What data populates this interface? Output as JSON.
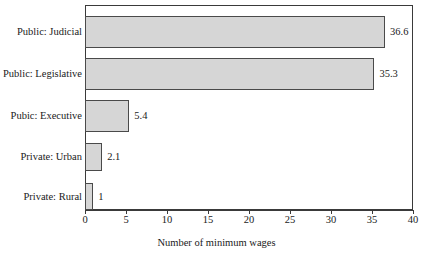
{
  "chart_data": {
    "type": "bar",
    "orientation": "horizontal",
    "title": "",
    "xlabel": "Number of minimum wages",
    "ylabel": "",
    "categories": [
      "Public: Judicial",
      "Public: Legislative",
      "Pubic: Executive",
      "Private: Urban",
      "Private: Rural"
    ],
    "values": [
      36.6,
      35.3,
      5.4,
      2.1,
      1
    ],
    "value_labels": [
      "36.6",
      "35.3",
      "5.4",
      "2.1",
      "1"
    ],
    "xlim": [
      0,
      40
    ],
    "xticks": [
      0,
      5,
      10,
      15,
      20,
      25,
      30,
      35,
      40
    ],
    "xtick_labels": [
      "0",
      "5",
      "10",
      "15",
      "20",
      "25",
      "30",
      "35",
      "40"
    ],
    "grid": false,
    "legend": null,
    "bar_fill_color": "#d6d6d6",
    "bar_edge_color": "#4a4a4a",
    "frame_color": "#3a3a3a",
    "background_color": "#ffffff"
  }
}
